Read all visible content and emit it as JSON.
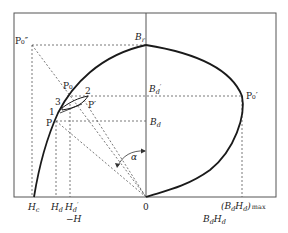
{
  "figure": {
    "type": "demagnetization and energy-product diagram",
    "labels": {
      "p0_double_prime": "P₀″",
      "br": "B",
      "br_sub": "r",
      "p0": "P₀",
      "point_2": "2",
      "point_3": "3",
      "point_1": "1",
      "p_prime": "P′",
      "p": "P",
      "bd_prime": "B",
      "bd_prime_sub": "d",
      "bd_prime_mark": "′",
      "bd": "B",
      "bd_sub": "d",
      "p0_prime": "P₀′",
      "alpha": "α",
      "hc": "H",
      "hc_sub": "c",
      "hd": "H",
      "hd_sub": "d",
      "hd_prime": "H",
      "hd_prime_sub": "d",
      "hd_prime_mark": "′",
      "neg_h": "−H",
      "origin": "0",
      "bdhd_max": "(B",
      "bdhd_max_mid": "H",
      "bdhd_max_close": ")",
      "bdhd_max_sub": "d",
      "max_suffix": "max",
      "bdhd_axis": "B",
      "bdhd_axis_mid": "H",
      "bdhd_axis_sub": "d"
    },
    "colors": {
      "curve": "#1a1a1a",
      "frame": "#555555",
      "dotted": "#555555",
      "text": "#222222"
    }
  }
}
